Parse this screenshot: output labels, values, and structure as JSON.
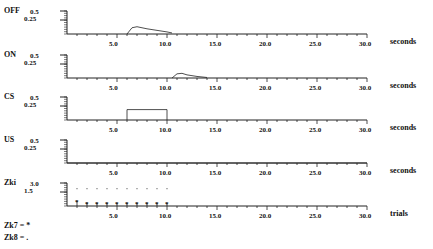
{
  "panels": [
    {
      "name": "OFF",
      "ytick_top": "0.5",
      "ytick_mid": "0.25",
      "xunit": "seconds"
    },
    {
      "name": "ON",
      "ytick_top": "0.5",
      "ytick_mid": "0.25",
      "xunit": "seconds"
    },
    {
      "name": "CS",
      "ytick_top": "0.5",
      "ytick_mid": "0.25",
      "xunit": "seconds"
    },
    {
      "name": "US",
      "ytick_top": "0.5",
      "ytick_mid": "0.25",
      "xunit": "seconds"
    },
    {
      "name": "Zki",
      "ytick_top": "3.0",
      "ytick_mid": "1.5",
      "xunit": "trials"
    }
  ],
  "xticks": [
    "5.0",
    "10.0",
    "15.0",
    "20.0",
    "25.0",
    "30.0"
  ],
  "legend": {
    "zk7": "Zk7 = *",
    "zk8": "Zk8 = ."
  },
  "chart_data": [
    {
      "type": "line",
      "title": "OFF",
      "xlabel": "seconds",
      "ylim": [
        0,
        0.5
      ],
      "xlim": [
        0,
        30
      ],
      "x": [
        6,
        6.5,
        7,
        8,
        9,
        10,
        10.5
      ],
      "values": [
        0,
        0.12,
        0.14,
        0.1,
        0.07,
        0.04,
        0.02
      ]
    },
    {
      "type": "line",
      "title": "ON",
      "xlabel": "seconds",
      "ylim": [
        0,
        0.5
      ],
      "xlim": [
        0,
        30
      ],
      "x": [
        10.5,
        11,
        11.5,
        12,
        13,
        14
      ],
      "values": [
        0,
        0.08,
        0.09,
        0.06,
        0.03,
        0.01
      ]
    },
    {
      "type": "line",
      "title": "CS",
      "xlabel": "seconds",
      "ylim": [
        0,
        0.5
      ],
      "xlim": [
        0,
        30
      ],
      "x": [
        6,
        6,
        10,
        10
      ],
      "values": [
        0,
        0.2,
        0.2,
        0
      ]
    },
    {
      "type": "line",
      "title": "US",
      "xlabel": "seconds",
      "ylim": [
        0,
        0.5
      ],
      "xlim": [
        0,
        30
      ],
      "x": [
        0,
        30
      ],
      "values": [
        0,
        0
      ]
    },
    {
      "type": "scatter",
      "title": "Zki",
      "xlabel": "trials",
      "ylim": [
        0,
        3.0
      ],
      "xlim": [
        0,
        30
      ],
      "series": [
        {
          "name": "Zk7",
          "marker": "*",
          "x": [
            1,
            2,
            3,
            4,
            5,
            6,
            7,
            8,
            9,
            10
          ],
          "values": [
            0.6,
            0.4,
            0.35,
            0.3,
            0.3,
            0.3,
            0.3,
            0.3,
            0.3,
            0.3
          ]
        },
        {
          "name": "Zk8",
          "marker": ".",
          "x": [
            1,
            2,
            3,
            4,
            5,
            6,
            7,
            8,
            9,
            10
          ],
          "values": [
            2.0,
            2.0,
            2.0,
            2.0,
            2.0,
            2.0,
            2.0,
            2.0,
            2.0,
            2.0
          ]
        }
      ]
    }
  ]
}
